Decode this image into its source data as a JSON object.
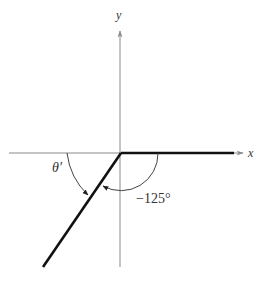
{
  "diagram": {
    "type": "angle-reference-diagram",
    "axes": {
      "x_label": "x",
      "y_label": "y"
    },
    "angles": {
      "standard_angle_label": "−125°",
      "standard_angle_value": -125,
      "reference_angle_label": "θ′"
    },
    "colors": {
      "axis": "#8a8a8a",
      "ray": "#111111",
      "arc": "#444444",
      "text": "#333333",
      "background": "#ffffff"
    }
  }
}
